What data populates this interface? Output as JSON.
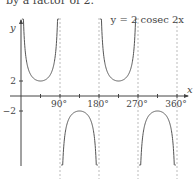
{
  "header": {
    "text": "by a factor of 2."
  },
  "chart_data": {
    "type": "line",
    "title": "y = 2 cosec 2x",
    "xlabel": "x",
    "ylabel": "y",
    "x_ticks": [
      "90°",
      "180°",
      "270°",
      "360°"
    ],
    "y_ticks": [
      "2",
      "−2"
    ],
    "xlim": [
      0,
      360
    ],
    "asymptotes_x": [
      0,
      90,
      180,
      270,
      360
    ],
    "series": [
      {
        "name": "y = 2 cosec 2x",
        "function": "2/sin(2x)",
        "turning_points": [
          {
            "x": 45,
            "y": 2
          },
          {
            "x": 135,
            "y": -2
          },
          {
            "x": 225,
            "y": 2
          },
          {
            "x": 315,
            "y": -2
          }
        ]
      }
    ],
    "grid": false
  }
}
